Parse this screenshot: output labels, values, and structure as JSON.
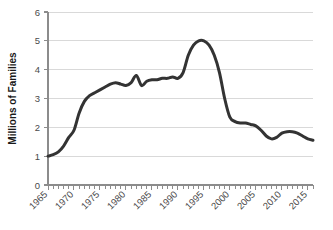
{
  "chart_data": {
    "type": "line",
    "title": "",
    "xlabel": "",
    "ylabel": "Millions of Families",
    "xlim": [
      1965,
      2016
    ],
    "ylim": [
      0,
      6
    ],
    "yticks": [
      0,
      1,
      2,
      3,
      4,
      5,
      6
    ],
    "ytick_labels": [
      "0",
      "1",
      "2",
      "3",
      "4",
      "5",
      "6"
    ],
    "xticks": [
      1965,
      1970,
      1975,
      1980,
      1985,
      1990,
      1995,
      2000,
      2005,
      2010,
      2015
    ],
    "xtick_labels": [
      "1965",
      "1970",
      "1975",
      "1980",
      "1985",
      "1990",
      "1995",
      "2000",
      "2005",
      "2010",
      "2015"
    ],
    "xtick_rotation_deg": 45,
    "x_minor_tick_interval": 1,
    "grid": "horizontal",
    "legend": "none",
    "line_color": "#333333",
    "line_width": 3.0,
    "grid_color": "#d9d9d9",
    "axis_color": "#8c8c8c",
    "series": [
      {
        "name": "Families",
        "x": [
          1965,
          1966,
          1967,
          1968,
          1969,
          1970,
          1971,
          1972,
          1973,
          1974,
          1975,
          1976,
          1977,
          1978,
          1979,
          1980,
          1981,
          1982,
          1983,
          1984,
          1985,
          1986,
          1987,
          1988,
          1989,
          1990,
          1991,
          1992,
          1993,
          1994,
          1995,
          1996,
          1997,
          1998,
          1999,
          2000,
          2001,
          2002,
          2003,
          2004,
          2005,
          2006,
          2007,
          2008,
          2009,
          2010,
          2011,
          2012,
          2013,
          2014,
          2015,
          2016
        ],
        "values": [
          1.0,
          1.05,
          1.15,
          1.35,
          1.65,
          1.9,
          2.5,
          2.9,
          3.1,
          3.2,
          3.3,
          3.4,
          3.5,
          3.55,
          3.5,
          3.45,
          3.55,
          3.8,
          3.45,
          3.6,
          3.65,
          3.65,
          3.7,
          3.7,
          3.75,
          3.7,
          3.9,
          4.5,
          4.85,
          5.0,
          5.0,
          4.85,
          4.5,
          3.9,
          3.0,
          2.35,
          2.2,
          2.15,
          2.15,
          2.1,
          2.05,
          1.9,
          1.7,
          1.6,
          1.65,
          1.8,
          1.85,
          1.85,
          1.8,
          1.7,
          1.6,
          1.55
        ]
      }
    ]
  },
  "axis": {
    "y_title": "Millions of Families"
  }
}
